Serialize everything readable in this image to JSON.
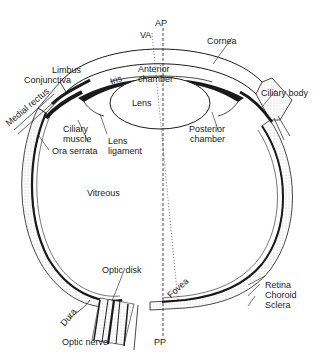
{
  "diagram": {
    "axis_labels": {
      "anterior_pole": "AP",
      "visual_axis": "VA",
      "posterior_pole": "PP"
    },
    "labels": {
      "cornea": "Cornea",
      "limbus": "Limbus",
      "conjunctiva": "Conjunctiva",
      "iris": "Iris",
      "anterior_chamber_1": "Anterior",
      "anterior_chamber_2": "chamber",
      "ciliary_body": "Ciliary body",
      "medial_rectus": "Medial rectus",
      "lens": "Lens",
      "ciliary_muscle_1": "Ciliary",
      "ciliary_muscle_2": "muscle",
      "lens_ligament_1": "Lens",
      "lens_ligament_2": "ligament",
      "posterior_chamber_1": "Posterior",
      "posterior_chamber_2": "chamber",
      "ora_serrata": "Ora serrata",
      "vitreous": "Vitreous",
      "optic_disk": "Optic disk",
      "fovea": "Fovea",
      "retina": "Retina",
      "choroid": "Choroid",
      "sclera": "Sclera",
      "dura": "Dura",
      "optic_nerve": "Optic nerve"
    },
    "colors": {
      "ink": "#1a1a1a",
      "stipple": "#bdbdbd",
      "background": "#ffffff"
    }
  }
}
